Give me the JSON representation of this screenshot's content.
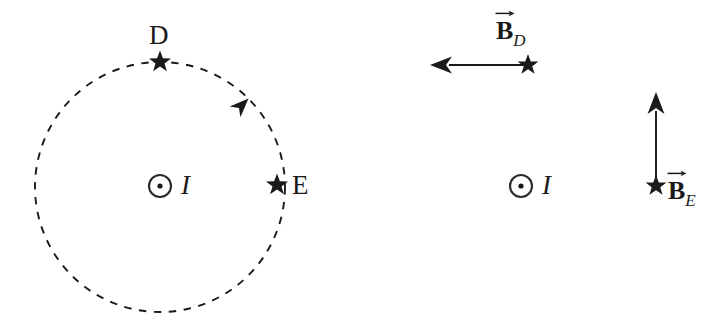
{
  "figure": {
    "background_color": "#ffffff",
    "ink_color": "#1a1a1a",
    "width": 719,
    "height": 325
  },
  "panels": [
    {
      "id": "left",
      "name": "field-line-panel",
      "description": "Dashed circular magnetic field line around current with points D and E marked by stars",
      "current": {
        "symbol": "circle-dot",
        "meaning": "current out of page",
        "label": "I",
        "center_x": 160,
        "center_y": 186,
        "radius": 11
      },
      "field_line": {
        "shape": "circle",
        "style": "dashed",
        "center_x": 160,
        "center_y": 187,
        "radius": 125,
        "direction": "counterclockwise",
        "arrow_angle_deg": 315
      },
      "points": [
        {
          "label": "D",
          "marker": "star",
          "x": 160,
          "y": 62,
          "label_x": 149,
          "label_y": 22
        },
        {
          "label": "E",
          "marker": "star",
          "x": 277,
          "y": 185,
          "label_x": 292,
          "label_y": 172
        }
      ]
    },
    {
      "id": "right",
      "name": "field-vector-panel",
      "description": "Magnetic field vectors at points D and E shown as arrows tangent to the field circle",
      "current": {
        "symbol": "circle-dot",
        "meaning": "current out of page",
        "label": "I",
        "center_x": 521,
        "center_y": 186,
        "radius": 11
      },
      "vectors": [
        {
          "name": "B_D",
          "base": "B",
          "subscript": "D",
          "overset": "vector-arrow",
          "origin_x": 528,
          "origin_y": 65,
          "tip_x": 430,
          "tip_y": 65,
          "direction": "left",
          "marker": "star",
          "label_x": 496,
          "label_y": 18
        },
        {
          "name": "B_E",
          "base": "B",
          "subscript": "E",
          "overset": "vector-arrow",
          "origin_x": 656,
          "origin_y": 186,
          "tip_x": 656,
          "tip_y": 92,
          "direction": "up",
          "marker": "star",
          "label_x": 668,
          "label_y": 178
        }
      ]
    }
  ],
  "labels": {
    "point_d": "D",
    "point_e": "E",
    "current_left": "I",
    "current_right": "I",
    "vector_b": "B",
    "sub_d": "D",
    "sub_e": "E"
  }
}
